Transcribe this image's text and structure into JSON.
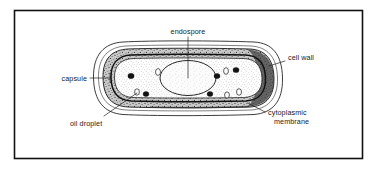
{
  "figure": {
    "border_color": "#111111",
    "background_color": "#ffffff",
    "ink_color": "#1a1a1a"
  },
  "labels": {
    "endospore": "endospore",
    "cell_wall": "cell wall",
    "capsule": "capsule",
    "oil_droplet": "oil droplet",
    "cytoplasmic_membrane_line1": "cytoplasmic",
    "cytoplasmic_membrane_line2": "membrane"
  },
  "structures": {
    "capsule": {
      "name": "capsule",
      "fill": "#ffffff",
      "stroke": "#1a1a1a"
    },
    "cell_wall": {
      "name": "cell wall",
      "fill": "#b8b8b8",
      "stroke": "#1a1a1a"
    },
    "cytoplasmic_membrane": {
      "name": "cytoplasmic membrane",
      "fill": "#3a3a3a",
      "stroke": "#111111"
    },
    "cytoplasm": {
      "name": "cytoplasm",
      "fill": "#ffffff",
      "stipple": "#555555"
    },
    "endospore": {
      "name": "endospore",
      "fill": "#f4f4f4",
      "stroke": "#1a1a1a"
    }
  },
  "inclusions": {
    "granules_label": "storage granules",
    "granule_color": "#141414",
    "droplet_color": "#ffffff",
    "granules": [
      {
        "cx": 131,
        "cy": 76,
        "rx": 3.1,
        "ry": 2.7
      },
      {
        "cx": 146,
        "cy": 94,
        "rx": 2.9,
        "ry": 2.5
      },
      {
        "cx": 217,
        "cy": 76,
        "rx": 3.0,
        "ry": 2.6
      },
      {
        "cx": 236,
        "cy": 70,
        "rx": 3.0,
        "ry": 2.6
      },
      {
        "cx": 210,
        "cy": 94,
        "rx": 2.9,
        "ry": 2.5
      }
    ],
    "droplets": [
      {
        "cx": 158,
        "cy": 72,
        "rx": 2.5,
        "ry": 3.4
      },
      {
        "cx": 226,
        "cy": 71,
        "rx": 2.4,
        "ry": 3.3
      },
      {
        "cx": 239,
        "cy": 92,
        "rx": 2.5,
        "ry": 3.3
      },
      {
        "cx": 227,
        "cy": 95,
        "rx": 2.4,
        "ry": 3.1
      },
      {
        "cx": 137,
        "cy": 92,
        "rx": 2.4,
        "ry": 3.2
      }
    ]
  }
}
